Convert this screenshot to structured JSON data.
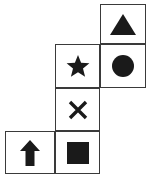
{
  "figure": {
    "background_color": "#ffffff",
    "stroke_color": "#3a3a3a",
    "fill_color": "#1a1a1a",
    "grid": {
      "columns": 3,
      "rows": 4,
      "cell_width": 50,
      "cell_height": 43,
      "column_edges": [
        5,
        55,
        100,
        146
      ],
      "row_edges": [
        4,
        44,
        88,
        131,
        174
      ]
    },
    "cells": [
      {
        "id": "cell-r1c3",
        "row": 1,
        "column": 3,
        "occupied": true,
        "icon": "triangle-icon",
        "shape": "triangle",
        "fill": "solid",
        "label": "filled triangle pointing up",
        "x": 100,
        "y": 4,
        "w": 46,
        "h": 40
      },
      {
        "id": "cell-r2c2",
        "row": 2,
        "column": 2,
        "occupied": true,
        "icon": "star-icon",
        "shape": "star",
        "points": 5,
        "fill": "solid",
        "label": "filled five-pointed star",
        "x": 55,
        "y": 44,
        "w": 45,
        "h": 44
      },
      {
        "id": "cell-r2c3",
        "row": 2,
        "column": 3,
        "occupied": true,
        "icon": "circle-icon",
        "shape": "circle",
        "fill": "solid",
        "label": "filled circle",
        "x": 100,
        "y": 44,
        "w": 46,
        "h": 44
      },
      {
        "id": "cell-r3c2",
        "row": 3,
        "column": 2,
        "occupied": true,
        "icon": "cross-x-icon",
        "shape": "x-mark",
        "fill": "stroke",
        "label": "X mark",
        "x": 55,
        "y": 88,
        "w": 45,
        "h": 43
      },
      {
        "id": "cell-r4c1",
        "row": 4,
        "column": 1,
        "occupied": true,
        "icon": "arrow-up-icon",
        "shape": "arrow-up",
        "fill": "solid",
        "label": "filled arrow pointing up",
        "x": 5,
        "y": 131,
        "w": 50,
        "h": 43
      },
      {
        "id": "cell-r4c2",
        "row": 4,
        "column": 2,
        "occupied": true,
        "icon": "square-icon",
        "shape": "square",
        "fill": "solid",
        "label": "filled square",
        "x": 55,
        "y": 131,
        "w": 45,
        "h": 43
      }
    ]
  }
}
